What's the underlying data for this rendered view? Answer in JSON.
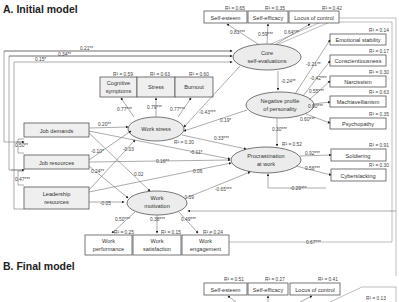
{
  "panels": {
    "a": {
      "title": "A. Initial model"
    },
    "b": {
      "title": "B. Final model"
    }
  },
  "nodes": {
    "core_self_evaluations": {
      "line1": "Core",
      "line2": "self-evaluations"
    },
    "negative_profile": {
      "line1": "Negative profile",
      "line2": "of personality"
    },
    "procrastination": {
      "line1": "Procrastination",
      "line2": "at work",
      "r2": "R² = 0.52"
    },
    "work_stress": {
      "label": "Work stress",
      "r2": "R² = 0.30"
    },
    "work_motivation": {
      "line1": "Work",
      "line2": "motivation",
      "r2": "R² = 0.59"
    },
    "job_demands": {
      "label": "Job demands"
    },
    "job_resources": {
      "label": "Job resources"
    },
    "leadership_resources": {
      "line1": "Leadership",
      "line2": "resources"
    },
    "self_esteem": {
      "label": "Self-esteem",
      "r2": "R² = 0.65"
    },
    "self_efficacy": {
      "label": "Self-efficacy",
      "r2": "R² = 0.35"
    },
    "locus_of_control": {
      "label": "Locus of control",
      "r2": "R² = 0.42"
    },
    "emotional_stability": {
      "label": "Emotional stability",
      "r2": "R² = 0.14"
    },
    "conscientiousness": {
      "label": "Conscientiousness",
      "r2": "R² = 0.17"
    },
    "narcissism": {
      "label": "Narcissism",
      "r2": "R² = 0.30"
    },
    "machiavellianism": {
      "label": "Machiavellianism",
      "r2": "R² = 0.63"
    },
    "psychopathy": {
      "label": "Psychopathy",
      "r2": "R² = 0.35"
    },
    "soldiering": {
      "label": "Soldiering",
      "r2": "R² = 0.91"
    },
    "cyberslacking": {
      "label": "Cyberslacking",
      "r2": "R² = 0.30"
    },
    "cognitive_symptoms": {
      "line1": "Cognitive",
      "line2": "symptoms",
      "r2": "R² = 0.59"
    },
    "stress": {
      "label": "Stress",
      "r2": "R² = 0.63"
    },
    "burnout": {
      "label": "Burnout",
      "r2": "R² = 0.60"
    },
    "work_performance": {
      "line1": "Work",
      "line2": "performance",
      "r2": "R² = 0.25"
    },
    "work_satisfaction": {
      "line1": "Work",
      "line2": "satisfaction",
      "r2": "R² = 0.15"
    },
    "work_engagement": {
      "line1": "Work",
      "line2": "engagement",
      "r2": "R² = 0.24"
    }
  },
  "paths": {
    "cse_self_esteem": "0.81***",
    "cse_self_efficacy": "0.59***",
    "cse_locus": "0.64***",
    "cse_negprofile": "-0.24**",
    "neg_emotional": "-0.21**",
    "neg_consc": "-0.42***",
    "neg_narc": "0.55***",
    "neg_mach": "0.80***",
    "neg_psycho": "0.60***",
    "neg_procr": "0.30***",
    "procr_soldiering": "0.92***",
    "procr_cyber": "0.56***",
    "cse_procr_loop": "-0.29***",
    "outer_067": "0.67***",
    "jd_cse": "0.21**",
    "jr_cse": "0.34**",
    "lr_cse": "0.15*",
    "ws_cog": "0.77***",
    "ws_stress": "0.79***",
    "ws_burnout": "0.77***",
    "jd_ws": "0.20**",
    "jd_jr_cov": "0.50**",
    "jr_lr_cov": "0.47***",
    "jr_ws": "-0.10*",
    "lr_ws": "-0.03",
    "jr_wm": "0.24**",
    "jd_wm": "0.02",
    "jd_procr": "-0.11*",
    "jr_procr": "0.16**",
    "lr_procr": "0.06",
    "lr_wm": "-0.05",
    "cse_ws": "-0.43***",
    "neg_ws": "0.19*",
    "ws_procr": "0.33***",
    "wm_procr": "-0.65***",
    "wm_perf": "0.50***",
    "wm_sat": "0.38***",
    "wm_eng": "0.49***"
  },
  "final_model": {
    "self_esteem": {
      "label": "Self-esteem",
      "r2": "R² = 0.51"
    },
    "self_efficacy": {
      "label": "Self-efficacy",
      "r2": "R² = 0.27"
    },
    "locus_of_control": {
      "label": "Locus of control",
      "r2": "R² = 0.41"
    },
    "partial_r2": "R² = 0.13"
  }
}
